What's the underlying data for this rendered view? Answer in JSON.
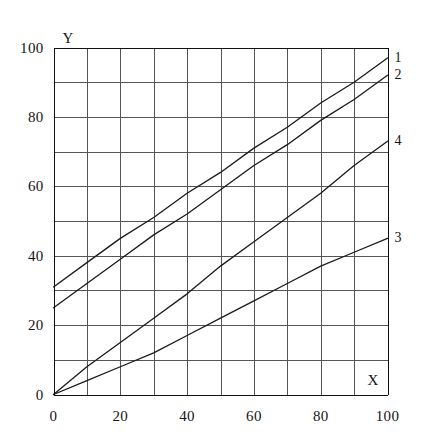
{
  "chart_data": {
    "type": "line",
    "title": "",
    "subtitle": "",
    "xlabel": "X",
    "ylabel": "Y",
    "xlim": [
      0,
      100
    ],
    "ylim": [
      0,
      100
    ],
    "grid": true,
    "grid_step_x": 10,
    "grid_step_y": 10,
    "legend_position": "right-end-of-line",
    "x_ticks": [
      0,
      20,
      40,
      60,
      80,
      100
    ],
    "y_ticks": [
      0,
      20,
      40,
      60,
      80,
      100
    ],
    "x_tick_labels": [
      "0",
      "20",
      "40",
      "60",
      "80",
      "100"
    ],
    "y_tick_labels": [
      "0",
      "20",
      "40",
      "60",
      "80",
      "100"
    ],
    "series": [
      {
        "name": "1",
        "label": "1",
        "color": "#1a1a1a",
        "x": [
          0,
          10,
          20,
          30,
          40,
          50,
          60,
          70,
          80,
          90,
          100
        ],
        "values": [
          31,
          38,
          45,
          51,
          58,
          64,
          71,
          77,
          84,
          90,
          97
        ]
      },
      {
        "name": "2",
        "label": "2",
        "color": "#1a1a1a",
        "x": [
          0,
          10,
          20,
          30,
          40,
          50,
          60,
          70,
          80,
          90,
          100
        ],
        "values": [
          25,
          32,
          39,
          46,
          52,
          59,
          66,
          72,
          79,
          85,
          92
        ]
      },
      {
        "name": "4",
        "label": "4",
        "color": "#1a1a1a",
        "x": [
          0,
          10,
          20,
          30,
          40,
          50,
          60,
          70,
          80,
          90,
          100
        ],
        "values": [
          0,
          8,
          15,
          22,
          29,
          37,
          44,
          51,
          58,
          66,
          73
        ]
      },
      {
        "name": "3",
        "label": "3",
        "color": "#1a1a1a",
        "x": [
          0,
          10,
          20,
          30,
          40,
          50,
          60,
          70,
          80,
          90,
          100
        ],
        "values": [
          0,
          4,
          8,
          12,
          17,
          22,
          27,
          32,
          37,
          41,
          45
        ]
      }
    ]
  },
  "axes": {
    "x_axis_name": "X",
    "y_axis_name": "Y"
  }
}
